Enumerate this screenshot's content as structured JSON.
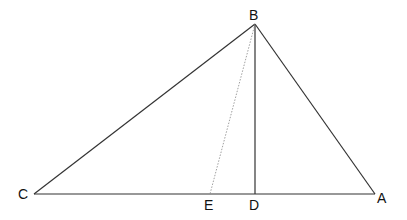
{
  "diagram": {
    "points": {
      "A": {
        "label": "A",
        "x": 375,
        "y": 194
      },
      "B": {
        "label": "B",
        "x": 255,
        "y": 24
      },
      "C": {
        "label": "C",
        "x": 34,
        "y": 194
      },
      "D": {
        "label": "D",
        "x": 255,
        "y": 194
      },
      "E": {
        "label": "E",
        "x": 210,
        "y": 194
      }
    },
    "segments": [
      {
        "from": "A",
        "to": "B",
        "style": "solid"
      },
      {
        "from": "B",
        "to": "C",
        "style": "solid"
      },
      {
        "from": "C",
        "to": "A",
        "style": "solid"
      },
      {
        "from": "B",
        "to": "D",
        "style": "solid"
      },
      {
        "from": "B",
        "to": "E",
        "style": "dotted"
      }
    ],
    "colors": {
      "line": "#333333",
      "dotted": "#888888"
    }
  }
}
